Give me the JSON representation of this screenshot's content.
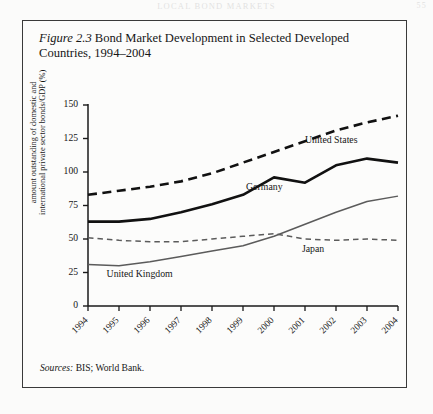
{
  "page_header": {
    "running_title": "LOCAL BOND MARKETS",
    "page_number": "55"
  },
  "figure": {
    "label": "Figure 2.3",
    "title": "Bond Market Development in Selected Developed Countries, 1994–2004",
    "source_label": "Sources:",
    "source_text": "BIS; World Bank."
  },
  "chart_data": {
    "type": "line",
    "title": "Bond Market Development in Selected Developed Countries, 1994–2004",
    "xlabel": "",
    "ylabel": "amount outstanding of domestic and international private sector bonds/GDP (%)",
    "ylabel_line1": "amount outstanding of domestic and",
    "ylabel_line2": "international private sector bonds/GDP (%)",
    "categories": [
      "1994",
      "1995",
      "1996",
      "1997",
      "1998",
      "1999",
      "2000",
      "2001",
      "2002",
      "2003",
      "2004"
    ],
    "x": [
      1994,
      1995,
      1996,
      1997,
      1998,
      1999,
      2000,
      2001,
      2002,
      2003,
      2004
    ],
    "xlim": [
      1994,
      2004
    ],
    "ylim": [
      0,
      150
    ],
    "yticks": [
      0,
      25,
      50,
      75,
      100,
      125,
      150
    ],
    "ytick_labels": [
      "0",
      "25",
      "50",
      "75",
      "100",
      "125",
      "150"
    ],
    "grid": false,
    "legend": "inline-annotations",
    "series": [
      {
        "name": "United States",
        "style": "dashed",
        "width": "thick",
        "color": "#111111",
        "values": [
          83,
          86,
          89,
          93,
          99,
          107,
          115,
          123,
          131,
          137,
          142
        ],
        "label_x": 2001.0,
        "label_y": 123
      },
      {
        "name": "Germany",
        "style": "solid",
        "width": "thick",
        "color": "#111111",
        "values": [
          63,
          63,
          65,
          70,
          76,
          83,
          96,
          92,
          105,
          110,
          107
        ],
        "label_x": 1999.1,
        "label_y": 88
      },
      {
        "name": "Japan",
        "style": "dashed",
        "width": "thin",
        "color": "#5b5b5b",
        "values": [
          51,
          49,
          48,
          48,
          50,
          52,
          54,
          50,
          49,
          50,
          49
        ],
        "label_x": 2000.9,
        "label_y": 42
      },
      {
        "name": "United Kingdom",
        "style": "solid",
        "width": "thin",
        "color": "#5b5b5b",
        "values": [
          31,
          30,
          33,
          37,
          41,
          45,
          52,
          61,
          70,
          78,
          82
        ],
        "label_x": 1994.6,
        "label_y": 23
      }
    ]
  }
}
